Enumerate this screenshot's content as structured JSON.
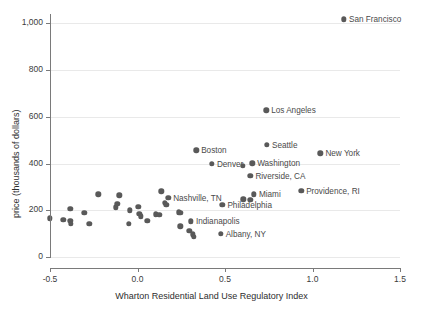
{
  "chart_data": {
    "type": "scatter",
    "title": "",
    "xlabel": "Wharton Residential Land Use Regulatory Index",
    "ylabel": "price (thousands of dollars)",
    "xlim": [
      -0.5,
      1.5
    ],
    "ylim": [
      0,
      1040
    ],
    "xticks": [
      -0.5,
      0.0,
      0.5,
      1.0,
      1.5
    ],
    "xticklabels": [
      "-0.5",
      "0.0",
      "0.5",
      "1.0",
      "1.5"
    ],
    "yticks": [
      0,
      200,
      400,
      600,
      800,
      1000
    ],
    "yticklabels": [
      "0",
      "200",
      "400",
      "600",
      "800",
      "1,000"
    ],
    "grid": true,
    "legend": "none",
    "marker_color": "#595959",
    "gridline_color": "#e9e9e9",
    "axis_color": "#7a7a7a",
    "points": [
      {
        "label": "San Francisco",
        "x": 1.18,
        "y": 1018,
        "label_side": "right"
      },
      {
        "label": "Los Angeles",
        "x": 0.735,
        "y": 628,
        "label_side": "right"
      },
      {
        "label": "Seattle",
        "x": 0.74,
        "y": 480,
        "label_side": "right"
      },
      {
        "label": "New York",
        "x": 1.045,
        "y": 443,
        "label_side": "right"
      },
      {
        "label": "Boston",
        "x": 0.335,
        "y": 456,
        "label_side": "right"
      },
      {
        "label": "Denver",
        "x": 0.425,
        "y": 399,
        "label_side": "right"
      },
      {
        "label": "Washington",
        "x": 0.655,
        "y": 401,
        "label_side": "right"
      },
      {
        "label": "Riverside, CA",
        "x": 0.645,
        "y": 348,
        "label_side": "right"
      },
      {
        "label": "Providence, RI",
        "x": 0.935,
        "y": 283,
        "label_side": "right"
      },
      {
        "label": "Miami",
        "x": 0.665,
        "y": 268,
        "label_side": "right"
      },
      {
        "label": "Nashville, TN",
        "x": 0.175,
        "y": 253,
        "label_side": "right"
      },
      {
        "label": "Philadelphia",
        "x": 0.485,
        "y": 224,
        "label_side": "right"
      },
      {
        "label": "Indianapolis",
        "x": 0.305,
        "y": 153,
        "label_side": "right"
      },
      {
        "label": "Albany, NY",
        "x": 0.475,
        "y": 99,
        "label_side": "right"
      },
      {
        "label": "",
        "x": 0.6,
        "y": 389,
        "label_side": "none"
      },
      {
        "label": "",
        "x": 0.605,
        "y": 247,
        "label_side": "none"
      },
      {
        "label": "",
        "x": 0.645,
        "y": 244,
        "label_side": "none"
      },
      {
        "label": "",
        "x": -0.5,
        "y": 166,
        "label_side": "none"
      },
      {
        "label": "",
        "x": -0.425,
        "y": 159,
        "label_side": "none"
      },
      {
        "label": "",
        "x": -0.385,
        "y": 206,
        "label_side": "none"
      },
      {
        "label": "",
        "x": -0.385,
        "y": 155,
        "label_side": "none"
      },
      {
        "label": "",
        "x": -0.38,
        "y": 141,
        "label_side": "none"
      },
      {
        "label": "",
        "x": -0.305,
        "y": 190,
        "label_side": "none"
      },
      {
        "label": "",
        "x": -0.275,
        "y": 143,
        "label_side": "none"
      },
      {
        "label": "",
        "x": -0.225,
        "y": 269,
        "label_side": "none"
      },
      {
        "label": "",
        "x": -0.125,
        "y": 212,
        "label_side": "none"
      },
      {
        "label": "",
        "x": -0.115,
        "y": 228,
        "label_side": "none"
      },
      {
        "label": "",
        "x": -0.105,
        "y": 264,
        "label_side": "none"
      },
      {
        "label": "",
        "x": -0.045,
        "y": 200,
        "label_side": "none"
      },
      {
        "label": "",
        "x": -0.05,
        "y": 143,
        "label_side": "none"
      },
      {
        "label": "",
        "x": 0.005,
        "y": 214,
        "label_side": "none"
      },
      {
        "label": "",
        "x": 0.01,
        "y": 186,
        "label_side": "none"
      },
      {
        "label": "",
        "x": 0.02,
        "y": 175,
        "label_side": "none"
      },
      {
        "label": "",
        "x": 0.055,
        "y": 155,
        "label_side": "none"
      },
      {
        "label": "",
        "x": 0.105,
        "y": 183,
        "label_side": "none"
      },
      {
        "label": "",
        "x": 0.125,
        "y": 180,
        "label_side": "none"
      },
      {
        "label": "",
        "x": 0.135,
        "y": 281,
        "label_side": "none"
      },
      {
        "label": "",
        "x": 0.155,
        "y": 231,
        "label_side": "none"
      },
      {
        "label": "",
        "x": 0.165,
        "y": 223,
        "label_side": "none"
      },
      {
        "label": "",
        "x": 0.235,
        "y": 192,
        "label_side": "none"
      },
      {
        "label": "",
        "x": 0.245,
        "y": 189,
        "label_side": "none"
      },
      {
        "label": "",
        "x": 0.245,
        "y": 131,
        "label_side": "none"
      },
      {
        "label": "",
        "x": 0.295,
        "y": 113,
        "label_side": "none"
      },
      {
        "label": "",
        "x": 0.315,
        "y": 97,
        "label_side": "none"
      },
      {
        "label": "",
        "x": 0.32,
        "y": 87,
        "label_side": "none"
      }
    ]
  }
}
